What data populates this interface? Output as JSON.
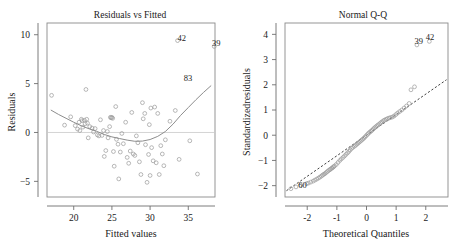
{
  "figure": {
    "background_color": "#ffffff",
    "point_color": "#9a9a9a",
    "curve_color": "#8d8d8d",
    "refline_color": "#2b2b2b",
    "frame_color": "#8a8a8a"
  },
  "panels": {
    "left": {
      "title": "Residuals vs Fitted",
      "xlabel": "Fitted values",
      "ylabel": "Residuals"
    },
    "right": {
      "title": "Normal Q-Q",
      "xlabel": "Theoretical Quantiles",
      "ylabel": "Standardizedresiduals"
    }
  },
  "chart_data": [
    {
      "type": "scatter",
      "title": "Residuals vs Fitted",
      "xlabel": "Fitted values",
      "ylabel": "Residuals",
      "xlim": [
        16.5,
        38.5
      ],
      "ylim": [
        -6.6,
        11.2
      ],
      "xticks": [
        20,
        25,
        30,
        35
      ],
      "yticks": [
        -5,
        0,
        5,
        10
      ],
      "grid": false,
      "legend": "none",
      "reference_line": {
        "type": "horizontal",
        "y": 0,
        "color": "#c9c9c9"
      },
      "smoother": {
        "type": "lowess",
        "color": "#8d8d8d",
        "points": [
          [
            17.0,
            2.3
          ],
          [
            18.0,
            1.85
          ],
          [
            19.0,
            1.45
          ],
          [
            20.0,
            1.05
          ],
          [
            21.0,
            0.68
          ],
          [
            22.0,
            0.38
          ],
          [
            23.0,
            0.12
          ],
          [
            24.0,
            -0.2
          ],
          [
            25.0,
            -0.45
          ],
          [
            26.0,
            -0.62
          ],
          [
            27.0,
            -0.78
          ],
          [
            28.0,
            -0.9
          ],
          [
            29.0,
            -0.88
          ],
          [
            30.0,
            -0.72
          ],
          [
            31.0,
            -0.4
          ],
          [
            32.0,
            0.1
          ],
          [
            33.0,
            0.85
          ],
          [
            34.0,
            1.75
          ],
          [
            35.0,
            2.55
          ],
          [
            36.0,
            3.35
          ],
          [
            37.0,
            4.1
          ],
          [
            38.0,
            4.8
          ]
        ]
      },
      "annotations": [
        {
          "label": "42",
          "x": 33.6,
          "y": 9.35
        },
        {
          "label": "39",
          "x": 38.1,
          "y": 8.8
        },
        {
          "label": "83",
          "x": 34.4,
          "y": 5.25
        }
      ],
      "points": [
        [
          17.1,
          3.8
        ],
        [
          18.8,
          0.75
        ],
        [
          19.6,
          1.6
        ],
        [
          20.2,
          0.7
        ],
        [
          20.5,
          0.35
        ],
        [
          20.7,
          1.05
        ],
        [
          20.8,
          0.2
        ],
        [
          21.0,
          1.35
        ],
        [
          21.1,
          1.2
        ],
        [
          21.2,
          0.55
        ],
        [
          21.4,
          1.25
        ],
        [
          21.5,
          0.9
        ],
        [
          21.6,
          4.4
        ],
        [
          21.7,
          1.35
        ],
        [
          21.8,
          0.95
        ],
        [
          21.9,
          -0.55
        ],
        [
          22.1,
          0.6
        ],
        [
          22.4,
          0.45
        ],
        [
          22.6,
          0.05
        ],
        [
          22.8,
          0.4
        ],
        [
          23.1,
          -0.25
        ],
        [
          23.3,
          -0.35
        ],
        [
          23.5,
          1.3
        ],
        [
          23.7,
          -0.3
        ],
        [
          23.9,
          0.2
        ],
        [
          24.0,
          -2.45
        ],
        [
          24.2,
          -1.85
        ],
        [
          24.4,
          0.1
        ],
        [
          24.5,
          -0.55
        ],
        [
          24.7,
          0.6
        ],
        [
          24.8,
          1.55
        ],
        [
          24.9,
          1.5
        ],
        [
          25.0,
          1.55
        ],
        [
          25.1,
          1.45
        ],
        [
          25.2,
          -1.95
        ],
        [
          25.3,
          -3.45
        ],
        [
          25.5,
          2.65
        ],
        [
          25.6,
          -0.7
        ],
        [
          25.8,
          -1.2
        ],
        [
          25.9,
          -4.75
        ],
        [
          26.1,
          -2.0
        ],
        [
          26.3,
          -0.1
        ],
        [
          26.5,
          -1.15
        ],
        [
          26.8,
          1.05
        ],
        [
          27.0,
          -2.55
        ],
        [
          27.2,
          -3.15
        ],
        [
          27.4,
          -1.9
        ],
        [
          27.6,
          2.05
        ],
        [
          27.8,
          -2.2
        ],
        [
          28.0,
          -2.35
        ],
        [
          28.2,
          -0.35
        ],
        [
          28.4,
          -1.05
        ],
        [
          28.6,
          -3.0
        ],
        [
          28.8,
          -4.3
        ],
        [
          29.0,
          3.05
        ],
        [
          29.1,
          1.4
        ],
        [
          29.3,
          1.95
        ],
        [
          29.4,
          -1.25
        ],
        [
          29.6,
          -5.1
        ],
        [
          29.8,
          -2.25
        ],
        [
          29.9,
          0.8
        ],
        [
          30.0,
          -4.4
        ],
        [
          30.1,
          2.5
        ],
        [
          30.2,
          -1.55
        ],
        [
          30.4,
          -2.9
        ],
        [
          30.6,
          2.6
        ],
        [
          30.8,
          -3.1
        ],
        [
          31.0,
          1.95
        ],
        [
          31.2,
          -4.3
        ],
        [
          31.4,
          -1.35
        ],
        [
          31.6,
          -2.2
        ],
        [
          31.8,
          -3.4
        ],
        [
          32.0,
          -0.75
        ],
        [
          32.6,
          1.15
        ],
        [
          33.3,
          2.25
        ],
        [
          33.6,
          9.4
        ],
        [
          33.8,
          -2.75
        ],
        [
          35.2,
          -0.85
        ],
        [
          36.2,
          -4.25
        ],
        [
          38.4,
          8.8
        ]
      ]
    },
    {
      "type": "scatter",
      "title": "Normal Q-Q",
      "xlabel": "Theoretical Quantiles",
      "ylabel": "Standardizedresiduals",
      "xlim": [
        -2.75,
        2.75
      ],
      "ylim": [
        -2.45,
        4.45
      ],
      "xticks": [
        -2,
        -1,
        0,
        1,
        2
      ],
      "yticks": [
        -2,
        -1,
        0,
        1,
        2,
        3,
        4
      ],
      "grid": false,
      "legend": "none",
      "reference_line": {
        "type": "diagonal",
        "style": "dashed",
        "color": "#2b2b2b",
        "from": [
          -2.7,
          -2.2
        ],
        "to": [
          2.7,
          2.2
        ]
      },
      "annotations": [
        {
          "label": "39",
          "x": 1.62,
          "y": 3.62
        },
        {
          "label": "42",
          "x": 2.0,
          "y": 3.78
        },
        {
          "label": "60",
          "x": -2.3,
          "y": -2.08
        }
      ],
      "points": [
        [
          -2.55,
          -2.12
        ],
        [
          -2.22,
          -1.98
        ],
        [
          -2.02,
          -1.92
        ],
        [
          -1.88,
          -1.86
        ],
        [
          -1.74,
          -1.78
        ],
        [
          -1.62,
          -1.7
        ],
        [
          -1.52,
          -1.62
        ],
        [
          -1.44,
          -1.55
        ],
        [
          -1.36,
          -1.48
        ],
        [
          -1.28,
          -1.4
        ],
        [
          -1.21,
          -1.34
        ],
        [
          -1.14,
          -1.28
        ],
        [
          -1.08,
          -1.22
        ],
        [
          -1.02,
          -1.16
        ],
        [
          -0.96,
          -1.08
        ],
        [
          -0.9,
          -1.0
        ],
        [
          -0.85,
          -0.94
        ],
        [
          -0.79,
          -0.88
        ],
        [
          -0.74,
          -0.82
        ],
        [
          -0.69,
          -0.76
        ],
        [
          -0.64,
          -0.7
        ],
        [
          -0.59,
          -0.64
        ],
        [
          -0.55,
          -0.58
        ],
        [
          -0.5,
          -0.52
        ],
        [
          -0.46,
          -0.48
        ],
        [
          -0.41,
          -0.44
        ],
        [
          -0.37,
          -0.4
        ],
        [
          -0.33,
          -0.36
        ],
        [
          -0.29,
          -0.32
        ],
        [
          -0.25,
          -0.28
        ],
        [
          -0.21,
          -0.24
        ],
        [
          -0.17,
          -0.2
        ],
        [
          -0.13,
          -0.16
        ],
        [
          -0.09,
          -0.12
        ],
        [
          -0.05,
          -0.07
        ],
        [
          -0.01,
          -0.02
        ],
        [
          0.03,
          0.03
        ],
        [
          0.07,
          0.08
        ],
        [
          0.11,
          0.12
        ],
        [
          0.15,
          0.16
        ],
        [
          0.19,
          0.2
        ],
        [
          0.23,
          0.25
        ],
        [
          0.27,
          0.29
        ],
        [
          0.31,
          0.33
        ],
        [
          0.35,
          0.37
        ],
        [
          0.39,
          0.41
        ],
        [
          0.44,
          0.45
        ],
        [
          0.48,
          0.49
        ],
        [
          0.52,
          0.53
        ],
        [
          0.57,
          0.57
        ],
        [
          0.61,
          0.6
        ],
        [
          0.66,
          0.63
        ],
        [
          0.71,
          0.66
        ],
        [
          0.76,
          0.68
        ],
        [
          0.81,
          0.7
        ],
        [
          0.87,
          0.72
        ],
        [
          0.93,
          0.76
        ],
        [
          0.99,
          0.82
        ],
        [
          1.05,
          0.88
        ],
        [
          1.12,
          0.94
        ],
        [
          1.19,
          1.0
        ],
        [
          1.27,
          1.08
        ],
        [
          1.35,
          1.16
        ],
        [
          1.44,
          1.26
        ],
        [
          1.5,
          1.8
        ],
        [
          1.62,
          1.92
        ],
        [
          1.7,
          3.58
        ],
        [
          2.12,
          3.72
        ],
        [
          -2.38,
          -2.05
        ],
        [
          -1.96,
          -1.9
        ],
        [
          -1.8,
          -1.82
        ],
        [
          -1.68,
          -1.74
        ],
        [
          -1.57,
          -1.66
        ],
        [
          -1.48,
          -1.58
        ],
        [
          -1.4,
          -1.52
        ],
        [
          -1.32,
          -1.44
        ],
        [
          -1.24,
          -1.37
        ],
        [
          -1.17,
          -1.31
        ],
        [
          -1.11,
          -1.25
        ]
      ]
    }
  ]
}
